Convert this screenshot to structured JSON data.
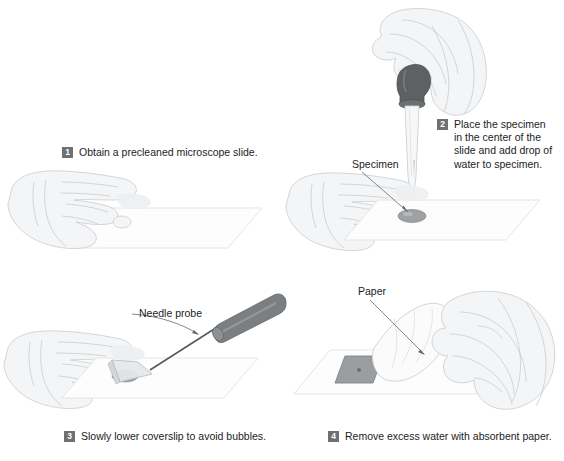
{
  "figure": {
    "background_color": "#ffffff",
    "badge_color": "#6e7072",
    "text_color": "#1c1c1c",
    "line_art_color": "#c9ccce",
    "probe_color": "#7b7f81",
    "bulb_color": "#5d6163",
    "specimen_color": "#8d9194"
  },
  "steps": [
    {
      "number": "1",
      "text": "Obtain a precleaned microscope slide.",
      "callouts": []
    },
    {
      "number": "2",
      "text": "Place the specimen\nin the center of the\nslide and add drop of\nwater to specimen.",
      "callouts": [
        {
          "label": "Specimen"
        }
      ]
    },
    {
      "number": "3",
      "text": "Slowly lower coverslip to avoid bubbles.",
      "callouts": [
        {
          "label": "Needle probe"
        }
      ]
    },
    {
      "number": "4",
      "text": "Remove excess water with absorbent paper.",
      "callouts": [
        {
          "label": "Paper"
        }
      ]
    }
  ]
}
